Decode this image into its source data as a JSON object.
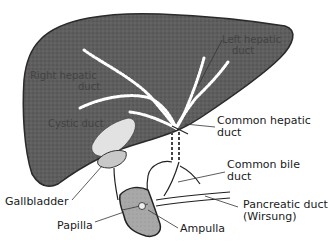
{
  "diagram": {
    "colors": {
      "liver": "#5a5a5a",
      "liver_outline": "#2a2a2a",
      "duct_highlight": "#ffffff",
      "gallbladder": "#d8d8d8",
      "duodenum": "#9a9a9a",
      "label_text": "#1a1a1a"
    },
    "inner_labels": {
      "left_hepatic_duct": [
        "Left hepatic",
        "duct"
      ],
      "right_hepatic_duct": [
        "Right hepatic",
        "duct"
      ],
      "cystic_duct": "Cystic duct"
    },
    "labels": {
      "common_hepatic_duct": [
        "Common hepatic",
        "duct"
      ],
      "common_bile_duct": [
        "Common bile",
        "duct"
      ],
      "pancreatic_duct": [
        "Pancreatic duct",
        "(Wirsung)"
      ],
      "gallbladder": "Gallbladder",
      "papilla": "Papilla",
      "ampulla": "Ampulla"
    }
  }
}
